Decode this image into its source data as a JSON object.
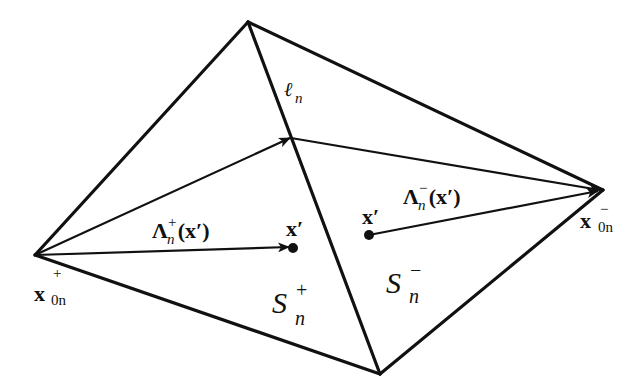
{
  "diagram": {
    "colors": {
      "stroke": "#111111",
      "background": "#ffffff"
    },
    "labels": {
      "x0n_plus": {
        "base": "x",
        "sup": "+",
        "sub": "0n"
      },
      "x0n_minus": {
        "base": "x",
        "sup": "−",
        "sub": "0n"
      },
      "edge_ln": {
        "base": "ℓ",
        "sub": "n"
      },
      "lambda_plus": {
        "base": "Λ",
        "sup": "+",
        "sub": "n",
        "arg": "(x′)"
      },
      "lambda_minus": {
        "base": "Λ",
        "sup": "−",
        "sub": "n",
        "arg": "(x′)"
      },
      "x_prime_left": "x′",
      "x_prime_right": "x′",
      "S_plus": {
        "base": "S",
        "sup": "+",
        "sub": "n"
      },
      "S_minus": {
        "base": "S",
        "sup": "−",
        "sub": "n"
      }
    },
    "nodes": [
      "x0n_plus (free vertex of S+)",
      "top shared vertex",
      "bottom shared vertex",
      "x0n_minus (free vertex of S−)"
    ],
    "edges": [
      "x0n_plus–top",
      "x0n_plus–bottom",
      "top–bottom (ℓn, shared)",
      "top–x0n_minus",
      "bottom–x0n_minus"
    ],
    "vectors": [
      "x0n_plus → midpoint of ℓn",
      "midpoint of ℓn → x0n_minus",
      "x0n_plus → x′ in S+ (Λn+(x′))",
      "x′ in S− → x0n_minus (Λn−(x′))"
    ]
  }
}
